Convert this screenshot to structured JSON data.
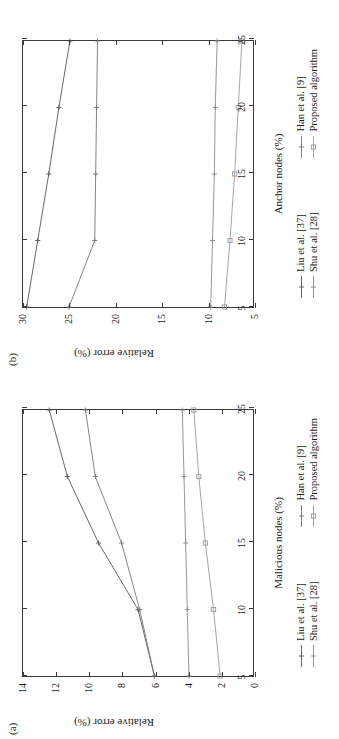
{
  "figure": {
    "panel_a_tag": "(a)",
    "panel_b_tag": "(b)"
  },
  "series_colors": {
    "liu": "#555555",
    "han": "#777777",
    "shu": "#8a8a8a",
    "proposed": "#9a9a9a"
  },
  "legend": {
    "items": [
      {
        "label": "Liu et al. [37]",
        "marker": "plus",
        "color": "#555555"
      },
      {
        "label": "Han et al. [9]",
        "marker": "plus",
        "color": "#777777"
      },
      {
        "label": "Shu et al. [28]",
        "marker": "plus",
        "color": "#8a8a8a"
      },
      {
        "label": "Proposed algorithm",
        "marker": "square",
        "color": "#9a9a9a"
      }
    ]
  },
  "chart_data": [
    {
      "id": "panel-a",
      "type": "line",
      "title": "(a)",
      "xlabel": "Malicious nodes (%)",
      "ylabel": "Relative error (%)",
      "x": [
        5,
        10,
        15,
        20,
        25
      ],
      "xticks": [
        "5",
        "10",
        "15",
        "20",
        "25"
      ],
      "yticks": [
        "0",
        "2",
        "4",
        "6",
        "8",
        "10",
        "12",
        "14"
      ],
      "xlim": [
        5,
        25
      ],
      "ylim": [
        0,
        14
      ],
      "grid": false,
      "legend_position": "below",
      "series": [
        {
          "name": "Liu et al. [37]",
          "values": [
            6.0,
            7.0,
            9.4,
            11.3,
            12.4
          ]
        },
        {
          "name": "Han et al. [9]",
          "values": [
            6.0,
            6.9,
            8.0,
            9.6,
            10.2
          ]
        },
        {
          "name": "Shu et al. [28]",
          "values": [
            3.9,
            4.0,
            4.1,
            4.2,
            4.3
          ]
        },
        {
          "name": "Proposed algorithm",
          "values": [
            2.0,
            2.4,
            2.9,
            3.3,
            3.6
          ]
        }
      ]
    },
    {
      "id": "panel-b",
      "type": "line",
      "title": "(b)",
      "xlabel": "Anchor nodes (%)",
      "ylabel": "Relative error (%)",
      "x": [
        5,
        10,
        15,
        20,
        25
      ],
      "xticks": [
        "5",
        "10",
        "15",
        "20",
        "25"
      ],
      "yticks": [
        "5",
        "10",
        "15",
        "20",
        "25",
        "30"
      ],
      "xlim": [
        5,
        25
      ],
      "ylim": [
        5,
        30
      ],
      "grid": false,
      "legend_position": "below",
      "series": [
        {
          "name": "Liu et al. [37]",
          "values": [
            29.6,
            28.4,
            27.2,
            26.1,
            24.9
          ]
        },
        {
          "name": "Han et al. [9]",
          "values": [
            25.0,
            22.2,
            22.1,
            22.0,
            21.9
          ]
        },
        {
          "name": "Shu et al. [28]",
          "values": [
            9.6,
            9.4,
            9.2,
            9.1,
            8.9
          ]
        },
        {
          "name": "Proposed algorithm",
          "values": [
            8.1,
            7.5,
            7.0,
            6.6,
            6.2
          ]
        }
      ]
    }
  ]
}
